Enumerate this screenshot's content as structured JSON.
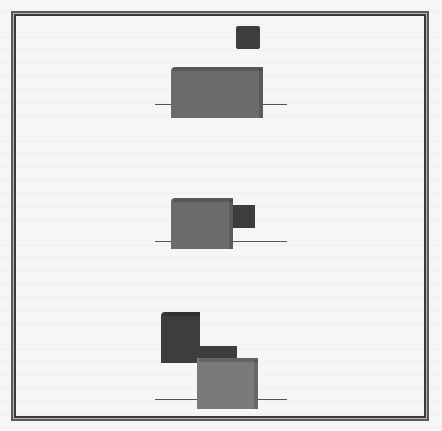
{
  "diagram": {
    "colors": {
      "frame": "#3a3a3a",
      "reference_line": "#555555",
      "block_mid_gray": "#6b6b6b",
      "block_dark_gray": "#3d3d3d",
      "block_light_gray": "#7a7a7a",
      "background": "#f6f6f6"
    },
    "groups": [
      {
        "name": "top",
        "blocks": [
          {
            "role": "small-square",
            "shade": "dark"
          },
          {
            "role": "large-box",
            "shade": "mid"
          }
        ]
      },
      {
        "name": "middle",
        "blocks": [
          {
            "role": "large-box",
            "shade": "mid"
          },
          {
            "role": "small-box-right",
            "shade": "dark"
          }
        ]
      },
      {
        "name": "bottom",
        "blocks": [
          {
            "role": "tall-box-left",
            "shade": "dark"
          },
          {
            "role": "connector-bar",
            "shade": "dark"
          },
          {
            "role": "large-box-right",
            "shade": "light"
          }
        ]
      }
    ]
  }
}
